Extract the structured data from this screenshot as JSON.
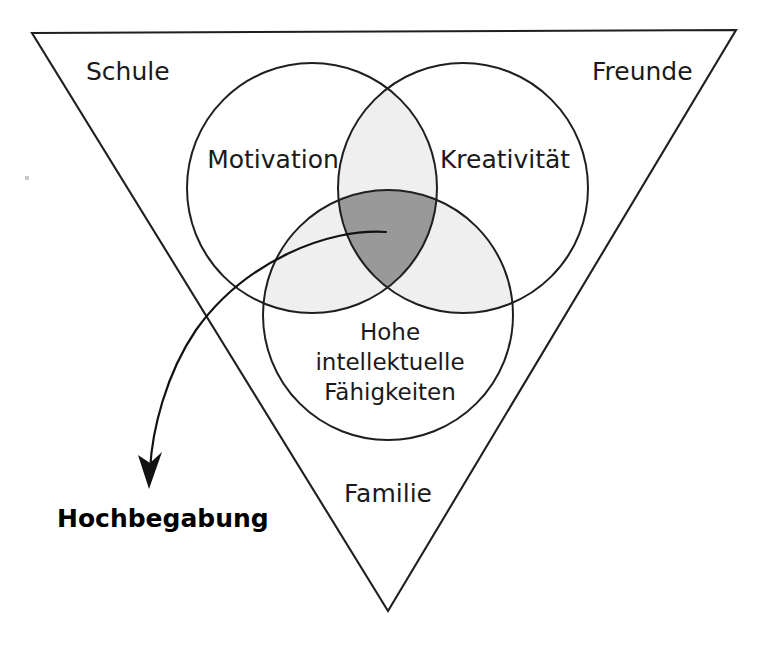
{
  "diagram": {
    "type": "venn-triangle-model",
    "title_text": "",
    "colors": {
      "stroke": "#1f1f1f",
      "text": "#1a1a1a",
      "pair_overlap_fill": "#efefef",
      "triple_overlap_fill": "#999999",
      "background": "#ffffff"
    },
    "triangle": {
      "name": "environment-triangle",
      "corner_labels": [
        {
          "id": "schule",
          "label": "Schule",
          "x": 86,
          "y": 80
        },
        {
          "id": "freunde",
          "label": "Freunde",
          "x": 592,
          "y": 80
        },
        {
          "id": "familie",
          "label": "Familie",
          "x": 344,
          "y": 502
        }
      ]
    },
    "circles": [
      {
        "id": "motivation",
        "label": "Motivation",
        "cx": 312,
        "cy": 188,
        "r": 125,
        "label_x": 273,
        "label_y": 168
      },
      {
        "id": "kreativitaet",
        "label": "Kreativität",
        "cx": 463,
        "cy": 188,
        "r": 125,
        "label_x": 505,
        "label_y": 168
      },
      {
        "id": "intellekt",
        "label_lines": [
          "Hohe",
          "intellektuelle",
          "Fähigkeiten"
        ],
        "cx": 388,
        "cy": 315,
        "r": 125,
        "label_x": 390,
        "label_y": 340
      }
    ],
    "annotation": {
      "id": "hochbegabung",
      "label": "Hochbegabung",
      "label_x": 57,
      "label_y": 527,
      "arrow_from": {
        "x": 386,
        "y": 232
      },
      "arrow_to": {
        "x": 149,
        "y": 487
      }
    }
  }
}
